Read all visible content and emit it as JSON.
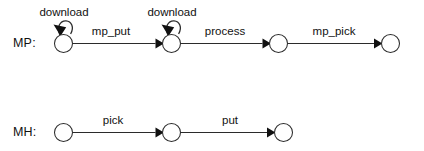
{
  "diagram": {
    "type": "state-machine",
    "background_color": "#ffffff",
    "line_color": "#2b2b2b",
    "text_color": "#111111",
    "rows": [
      {
        "id": "mp",
        "label": "MP:",
        "label_x": 13,
        "label_y": 46,
        "states": [
          {
            "id": "mp-s0",
            "cx": 63.5,
            "cy": 43.5,
            "r": 9.0
          },
          {
            "id": "mp-s1",
            "cx": 171.5,
            "cy": 43.5,
            "r": 9.0
          },
          {
            "id": "mp-s2",
            "cx": 278.5,
            "cy": 43.5,
            "r": 9.0
          },
          {
            "id": "mp-s3",
            "cx": 390.5,
            "cy": 43.5,
            "r": 9.0
          }
        ],
        "self_loops": [
          {
            "id": "mp-loop-0",
            "state": "mp-s0",
            "label": "download",
            "label_x": 64,
            "label_y": 15
          },
          {
            "id": "mp-loop-1",
            "state": "mp-s1",
            "label": "download",
            "label_x": 172,
            "label_y": 15
          }
        ],
        "transitions": [
          {
            "id": "mp-t0",
            "from": "mp-s0",
            "to": "mp-s1",
            "label": "mp_put",
            "label_x": 111,
            "label_y": 35
          },
          {
            "id": "mp-t1",
            "from": "mp-s1",
            "to": "mp-s2",
            "label": "process",
            "label_x": 225,
            "label_y": 35
          },
          {
            "id": "mp-t2",
            "from": "mp-s2",
            "to": "mp-s3",
            "label": "mp_pick",
            "label_x": 334,
            "label_y": 35
          }
        ]
      },
      {
        "id": "mh",
        "label": "MH:",
        "label_x": 13,
        "label_y": 136,
        "states": [
          {
            "id": "mh-s0",
            "cx": 63.5,
            "cy": 132.5,
            "r": 9.0
          },
          {
            "id": "mh-s1",
            "cx": 171.5,
            "cy": 132.5,
            "r": 9.0
          },
          {
            "id": "mh-s2",
            "cx": 283.5,
            "cy": 132.5,
            "r": 9.0
          }
        ],
        "self_loops": [],
        "transitions": [
          {
            "id": "mh-t0",
            "from": "mh-s0",
            "to": "mh-s1",
            "label": "pick",
            "label_x": 113,
            "label_y": 124
          },
          {
            "id": "mh-t1",
            "from": "mh-s1",
            "to": "mh-s2",
            "label": "put",
            "label_x": 230,
            "label_y": 124
          }
        ]
      }
    ]
  }
}
